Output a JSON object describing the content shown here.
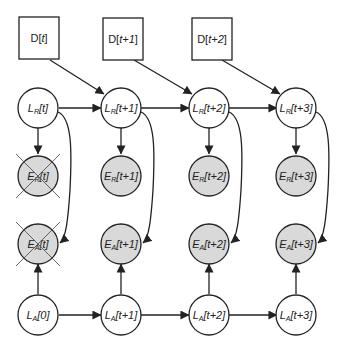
{
  "diagram": {
    "type": "dynamic bayesian network",
    "colors": {
      "stroke": "#222222",
      "observed_fill": "#d9d9d9",
      "hidden_fill": "#ffffff",
      "cross": "#555555"
    },
    "data_nodes": [
      {
        "id": "D_t",
        "main": "D[",
        "arg": "t",
        "close": "]",
        "label": "D[t]"
      },
      {
        "id": "D_t1",
        "main": "D[",
        "arg": "t+1",
        "close": "]",
        "label": "D[t+1]"
      },
      {
        "id": "D_t2",
        "main": "D[",
        "arg": "t+2",
        "close": "]",
        "label": "D[t+2]"
      }
    ],
    "rows": {
      "LR": {
        "letter": "L",
        "sub": "R",
        "labels": [
          "t]",
          "t+1]",
          "t+2]",
          "t+3]"
        ],
        "full": [
          "L_R[t]",
          "L_R[t+1]",
          "L_R[t+2]",
          "L_R[t+3]"
        ]
      },
      "ER": {
        "letter": "E",
        "sub": "R",
        "labels": [
          "t]",
          "t+1]",
          "t+2]",
          "t+3]"
        ],
        "full": [
          "E_R[t]",
          "E_R[t+1]",
          "E_R[t+2]",
          "E_R[t+3]"
        ],
        "crossed": [
          true,
          false,
          false,
          false
        ]
      },
      "EA": {
        "letter": "E",
        "sub": "A",
        "labels": [
          "t]",
          "t+1]",
          "t+2]",
          "t+3]"
        ],
        "full": [
          "E_A[t]",
          "E_A[t+1]",
          "E_A[t+2]",
          "E_A[t+3]"
        ],
        "crossed": [
          true,
          false,
          false,
          false
        ]
      },
      "LA": {
        "letter": "L",
        "sub": "A",
        "labels": [
          "0]",
          "t+1]",
          "t+2]",
          "t+3]"
        ],
        "full": [
          "L_A[0]",
          "L_A[t+1]",
          "L_A[t+2]",
          "L_A[t+3]"
        ]
      }
    },
    "edges": [
      "D[t] -> L_R[t+1]",
      "D[t+1] -> L_R[t+2]",
      "D[t+2] -> L_R[t+3]",
      "L_R[t] -> L_R[t+1]",
      "L_R[t+1] -> L_R[t+2]",
      "L_R[t+2] -> L_R[t+3]",
      "L_R[t] -> E_R[t]",
      "L_R[t+1] -> E_R[t+1]",
      "L_R[t+2] -> E_R[t+2]",
      "L_R[t+3] -> E_R[t+3]",
      "L_R[t] -> E_A[t]",
      "L_R[t+1] -> E_A[t+1]",
      "L_R[t+2] -> E_A[t+2]",
      "L_R[t+3] -> E_A[t+3]",
      "L_A[0] -> E_A[t]",
      "L_A[t+1] -> E_A[t+1]",
      "L_A[t+2] -> E_A[t+2]",
      "L_A[t+3] -> E_A[t+3]",
      "L_A[0] -> L_A[t+1]",
      "L_A[t+1] -> L_A[t+2]",
      "L_A[t+2] -> L_A[t+3]"
    ]
  }
}
